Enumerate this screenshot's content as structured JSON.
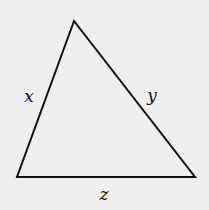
{
  "diagram": {
    "type": "triangle",
    "stroke_color": "#111111",
    "background_color": "#efefef",
    "vertices": {
      "top": [
        74,
        21
      ],
      "bottom_left": [
        17,
        177
      ],
      "bottom_right": [
        195,
        177
      ]
    },
    "sides": [
      {
        "id": "left",
        "label": "x",
        "from": "bottom_left",
        "to": "top"
      },
      {
        "id": "right",
        "label": "y",
        "from": "top",
        "to": "bottom_right"
      },
      {
        "id": "bottom",
        "label": "z",
        "from": "bottom_left",
        "to": "bottom_right"
      }
    ]
  }
}
